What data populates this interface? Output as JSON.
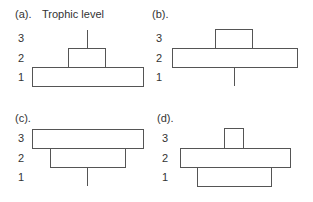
{
  "header": {
    "axis_title": "Trophic level"
  },
  "panels": [
    {
      "id": "a",
      "label": "(a).",
      "levels": [
        "3",
        "2",
        "1"
      ],
      "shape": "upright pyramid with narrow top stem",
      "bars": [
        {
          "level": "1",
          "type": "box",
          "relative_width": "wide"
        },
        {
          "level": "2",
          "type": "box",
          "relative_width": "medium"
        },
        {
          "level": "3",
          "type": "line",
          "relative_width": "minimal"
        }
      ]
    },
    {
      "id": "b",
      "label": "(b).",
      "levels": [
        "3",
        "2",
        "1"
      ],
      "shape": "level 1 minimal line, level 2 wide, level 3 medium",
      "bars": [
        {
          "level": "1",
          "type": "line",
          "relative_width": "minimal"
        },
        {
          "level": "2",
          "type": "box",
          "relative_width": "wide"
        },
        {
          "level": "3",
          "type": "box",
          "relative_width": "medium"
        }
      ]
    },
    {
      "id": "c",
      "label": "(c).",
      "levels": [
        "3",
        "2",
        "1"
      ],
      "shape": "inverted pyramid",
      "bars": [
        {
          "level": "1",
          "type": "line",
          "relative_width": "minimal"
        },
        {
          "level": "2",
          "type": "box",
          "relative_width": "medium"
        },
        {
          "level": "3",
          "type": "box",
          "relative_width": "wide"
        }
      ]
    },
    {
      "id": "d",
      "label": "(d).",
      "levels": [
        "3",
        "2",
        "1"
      ],
      "shape": "level 2 widest, level 1 medium, level 3 narrow",
      "bars": [
        {
          "level": "1",
          "type": "box",
          "relative_width": "medium"
        },
        {
          "level": "2",
          "type": "box",
          "relative_width": "wide"
        },
        {
          "level": "3",
          "type": "box",
          "relative_width": "narrow"
        }
      ]
    }
  ]
}
